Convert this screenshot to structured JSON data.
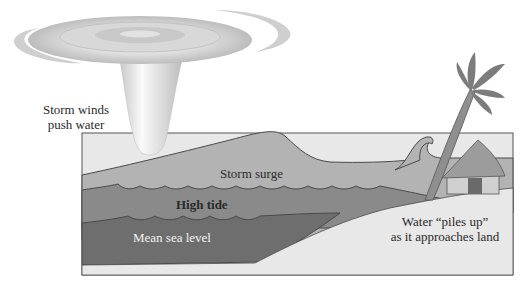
{
  "diagram": {
    "labels": {
      "storm_winds_line1": "Storm winds",
      "storm_winds_line2": "push water",
      "storm_surge": "Storm surge",
      "high_tide": "High tide",
      "mean_sea_level": "Mean sea level",
      "piles_up_line1": "Water “piles up”",
      "piles_up_line2": "as it approaches land"
    },
    "colors": {
      "storm_surge_layer": "#b3b3b3",
      "high_tide_layer": "#8a8a8a",
      "mean_sea_level_layer": "#6e6e6e",
      "land": "#e8e8e8",
      "outline": "#4a4a4a",
      "hurricane": "#d4d4d4"
    }
  }
}
